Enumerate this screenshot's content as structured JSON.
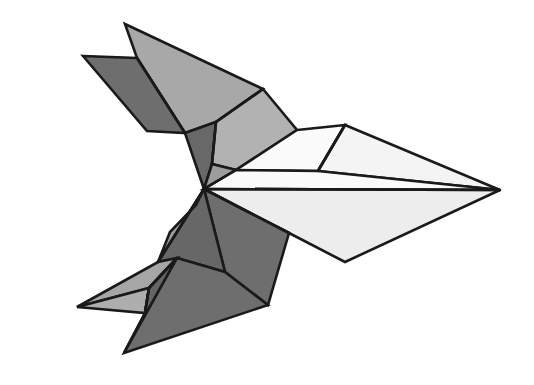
{
  "figure": {
    "title": "Origami Bird Facet Diagram",
    "kind": "flat-shaded polygonal origami illustration",
    "canvas": {
      "width": 534,
      "height": 385,
      "background": "#ffffff"
    },
    "palette": {
      "outline": "#1a1a1a",
      "white": "#fbfbfb",
      "near_white": "#f2f2f2",
      "light_gray": "#e6e6e6",
      "mid_light_gray": "#b8b8b8",
      "mid_gray": "#a8a8a8",
      "gray": "#9a9a9a",
      "dark_gray": "#6e6e6e",
      "darkest_gray": "#636363"
    },
    "stroke_width": 2.6,
    "facet_count": 16,
    "facets": [
      {
        "name": "upper-left-wing-top-light",
        "tone": "mid_gray",
        "fill": "#a8a8a8",
        "points": "125,24 263,89 216,122 185,133 137,58"
      },
      {
        "name": "upper-left-wing-under-dark",
        "tone": "dark_gray",
        "fill": "#6e6e6e",
        "points": "83,56 137,58 185,133 147,131"
      },
      {
        "name": "upper-left-wing-lower-ridge-dark",
        "tone": "darkest_gray",
        "fill": "#686868",
        "points": "185,133 216,122 212,164 204,189"
      },
      {
        "name": "neck-upper-facet-light",
        "tone": "mid_light_gray",
        "fill": "#b2b2b2",
        "points": "263,89 297,130 236,170 212,164 216,122"
      },
      {
        "name": "neck-lower-facet-gray",
        "tone": "gray",
        "fill": "#9d9d9d",
        "points": "212,164 236,170 204,189"
      },
      {
        "name": "head-top-white",
        "tone": "white",
        "fill": "#fbfbfb",
        "points": "297,130 345,125 318,171 236,170"
      },
      {
        "name": "head-wedge-white",
        "tone": "near_white",
        "fill": "#f4f4f4",
        "points": "345,125 500,190 318,171"
      },
      {
        "name": "beak-upper-white",
        "tone": "white",
        "fill": "#fafafa",
        "points": "236,170 318,171 500,190 204,189"
      },
      {
        "name": "beak-lower-white",
        "tone": "light_gray",
        "fill": "#ededed",
        "points": "204,189 500,190 345,262 289,233"
      },
      {
        "name": "breast-dark-band",
        "tone": "dark_gray",
        "fill": "#6e6e6e",
        "points": "204,189 289,233 268,305 225,272"
      },
      {
        "name": "breast-lower-dark-wedge",
        "tone": "darkest_gray",
        "fill": "#676767",
        "points": "204,189 225,272 177,258 158,262"
      },
      {
        "name": "lower-body-mid-gray",
        "tone": "gray",
        "fill": "#9f9f9f",
        "points": "204,189 158,262 170,232 196,205"
      },
      {
        "name": "tail-upper-light",
        "tone": "mid_gray",
        "fill": "#a6a6a6",
        "points": "158,262 177,258 149,288 77,307"
      },
      {
        "name": "tail-lower-light",
        "tone": "mid_light_gray",
        "fill": "#aeaeae",
        "points": "77,307 149,288 145,313"
      },
      {
        "name": "tail-dark-fin",
        "tone": "dark_gray",
        "fill": "#6e6e6e",
        "points": "177,258 225,272 268,305 124,353 145,313 149,288"
      },
      {
        "name": "tail-notch-shadow",
        "tone": "darkest_gray",
        "fill": "#656565",
        "points": "149,288 145,313 124,353 177,258"
      }
    ],
    "crease_lines": [
      {
        "name": "crease-upper-wing-fold",
        "points": "137,58 185,133"
      },
      {
        "name": "crease-wing-to-neck",
        "points": "216,122 263,89"
      },
      {
        "name": "crease-neck-spine",
        "points": "212,164 216,122"
      },
      {
        "name": "crease-neck-to-center",
        "points": "236,170 204,189"
      },
      {
        "name": "crease-head-fold",
        "points": "318,171 345,125"
      },
      {
        "name": "crease-beak-midline",
        "points": "204,189 500,190"
      },
      {
        "name": "crease-breast-fold",
        "points": "204,189 289,233"
      },
      {
        "name": "crease-lower-body",
        "points": "204,189 158,262"
      },
      {
        "name": "crease-tail-fold",
        "points": "149,288 177,258"
      },
      {
        "name": "crease-tail-tip",
        "points": "145,313 149,288"
      }
    ],
    "key_vertices": [
      {
        "name": "vertex-upper-wing-tip",
        "x": 125,
        "y": 24
      },
      {
        "name": "vertex-secondary-wing-tip",
        "x": 83,
        "y": 56
      },
      {
        "name": "vertex-wing-notch",
        "x": 137,
        "y": 58
      },
      {
        "name": "vertex-neck-peak",
        "x": 263,
        "y": 89
      },
      {
        "name": "vertex-head-top",
        "x": 345,
        "y": 125
      },
      {
        "name": "vertex-beak-point",
        "x": 500,
        "y": 190
      },
      {
        "name": "vertex-central-junction",
        "x": 204,
        "y": 189
      },
      {
        "name": "vertex-lower-wing-bottom",
        "x": 345,
        "y": 262
      },
      {
        "name": "vertex-tail-fin-tip",
        "x": 268,
        "y": 305
      },
      {
        "name": "vertex-tail-bottom-tip",
        "x": 124,
        "y": 353
      },
      {
        "name": "vertex-tail-left-tip",
        "x": 77,
        "y": 307
      }
    ]
  }
}
